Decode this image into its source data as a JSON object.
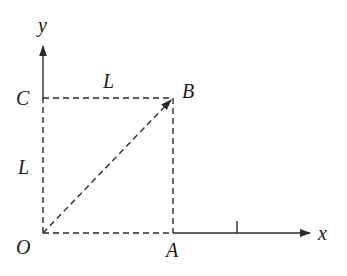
{
  "diagram": {
    "type": "coordinate-geometry",
    "axes": {
      "x_label": "x",
      "y_label": "y"
    },
    "points": {
      "O": "O",
      "A": "A",
      "B": "B",
      "C": "C"
    },
    "dimensions": {
      "top_length": "L",
      "left_length": "L"
    },
    "colors": {
      "stroke": "#2a2a2a",
      "background": "#ffffff"
    }
  }
}
